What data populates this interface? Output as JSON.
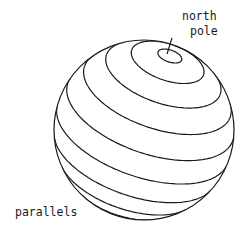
{
  "diagram": {
    "title_label_line1": "north",
    "title_label_line2": "pole",
    "parallels_label": "parallels",
    "parallel_count": 10,
    "stroke_color": "#1a1a1a",
    "background": "#ffffff"
  }
}
